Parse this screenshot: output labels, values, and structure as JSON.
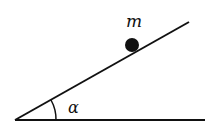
{
  "diagram": {
    "mass_label": "m",
    "angle_label": "α",
    "line_color": "#111111"
  }
}
